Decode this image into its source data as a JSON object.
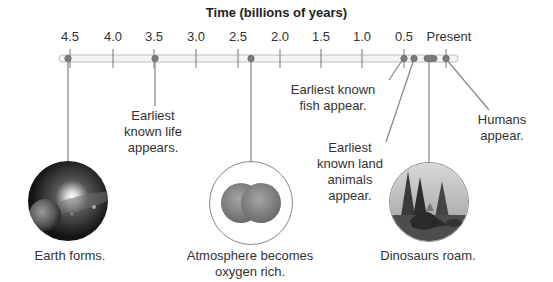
{
  "title": "Time (billions of years)",
  "axis": {
    "ticks": [
      {
        "label": "4.5",
        "x": 70
      },
      {
        "label": "4.0",
        "x": 113
      },
      {
        "label": "3.5",
        "x": 154
      },
      {
        "label": "3.0",
        "x": 196
      },
      {
        "label": "2.5",
        "x": 238
      },
      {
        "label": "2.0",
        "x": 280
      },
      {
        "label": "1.5",
        "x": 321
      },
      {
        "label": "1.0",
        "x": 362
      },
      {
        "label": "0.5",
        "x": 404
      },
      {
        "label": "Present",
        "x": 446
      }
    ]
  },
  "events": [
    {
      "id": "earth-forms",
      "caption": "Earth forms.",
      "time_bya": 4.5,
      "image": "early-earth-icon"
    },
    {
      "id": "earliest-life",
      "caption_lines": [
        "Earliest",
        "known life",
        "appears."
      ],
      "time_bya": 3.5
    },
    {
      "id": "oxygen",
      "caption_lines": [
        "Atmosphere becomes",
        "oxygen rich."
      ],
      "time_bya": 2.3,
      "image": "oxygen-molecule-icon"
    },
    {
      "id": "fish",
      "caption_lines": [
        "Earliest known",
        "fish appear."
      ],
      "time_bya": 0.5
    },
    {
      "id": "land-animals",
      "caption_lines": [
        "Earliest",
        "known land",
        "animals",
        "appear."
      ],
      "time_bya": 0.4
    },
    {
      "id": "dinosaurs",
      "caption": "Dinosaurs roam.",
      "time_range_bya": [
        0.23,
        0.066
      ],
      "image": "dinosaur-forest-icon"
    },
    {
      "id": "humans",
      "caption_lines": [
        "Humans",
        "appear."
      ],
      "time_bya": 0.0
    }
  ],
  "labels": {
    "earth": "Earth forms.",
    "life": [
      "Earliest",
      "known life",
      "appears."
    ],
    "oxygen": [
      "Atmosphere becomes",
      "oxygen rich."
    ],
    "fish": [
      "Earliest known",
      "fish appear."
    ],
    "land": [
      "Earliest",
      "known land",
      "animals",
      "appear."
    ],
    "dinos": "Dinosaurs roam.",
    "humans": [
      "Humans",
      "appear."
    ]
  }
}
